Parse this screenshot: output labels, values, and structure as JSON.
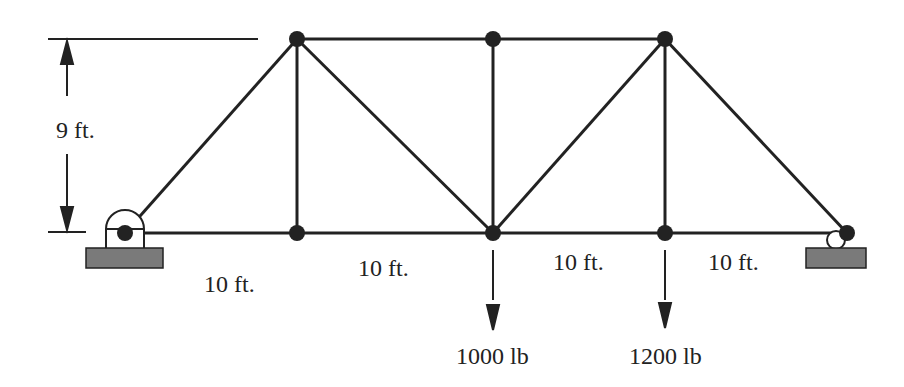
{
  "diagram": {
    "type": "truss",
    "colors": {
      "member": "#222222",
      "support_fill": "#7a7a7a",
      "background": "#ffffff"
    },
    "dimensions": {
      "height_label": "9 ft.",
      "panels": [
        "10 ft.",
        "10 ft.",
        "10 ft.",
        "10 ft."
      ]
    },
    "loads": [
      {
        "label": "1000 lb",
        "joint": "bottom-middle"
      },
      {
        "label": "1200 lb",
        "joint": "bottom-right-inner"
      }
    ],
    "joints": {
      "bottom": [
        [
          125,
          233
        ],
        [
          297,
          233
        ],
        [
          493,
          233
        ],
        [
          665,
          233
        ],
        [
          847,
          233
        ]
      ],
      "top": [
        [
          297,
          39
        ],
        [
          493,
          39
        ],
        [
          665,
          39
        ]
      ]
    },
    "supports": {
      "left": "pin",
      "right": "roller"
    }
  }
}
